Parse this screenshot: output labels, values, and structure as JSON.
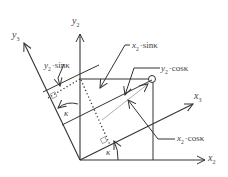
{
  "diagram": {
    "type": "coordinate-rotation",
    "axes": {
      "x2": {
        "var": "x",
        "sub": "2"
      },
      "y2": {
        "var": "y",
        "sub": "2"
      },
      "x3": {
        "var": "x",
        "sub": "3"
      },
      "y3": {
        "var": "y",
        "sub": "3"
      }
    },
    "angle_symbol": "κ",
    "annotations": {
      "y2_sin": {
        "var": "y",
        "sub": "2",
        "dot": "·",
        "fn": "sinκ"
      },
      "x2_sin": {
        "var": "x",
        "sub": "2",
        "dot": "·",
        "fn": "sinκ"
      },
      "y2_cos": {
        "var": "y",
        "sub": "2",
        "dot": "·",
        "fn": "cosκ"
      },
      "x2_cos": {
        "var": "x",
        "sub": "2",
        "dot": "·",
        "fn": "cosκ"
      }
    },
    "colors": {
      "line": "#333333",
      "text": "#444444",
      "background": "#ffffff"
    }
  }
}
